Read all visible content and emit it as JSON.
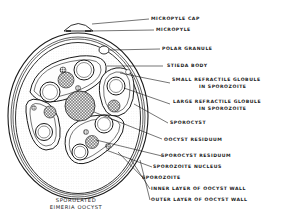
{
  "diagram": {
    "title_line1": "SPORULATED",
    "title_line2": "EIMERIA OOCYST",
    "labels": [
      {
        "id": "micropyle-cap",
        "text": "MICROPYLE CAP"
      },
      {
        "id": "micropyle",
        "text": "MICROPYLE"
      },
      {
        "id": "polar-granule",
        "text": "POLAR GRANULE"
      },
      {
        "id": "stieda-body",
        "text": "STIEDA BODY"
      },
      {
        "id": "small-refractile-globule",
        "line1": "SMALL REFRACTILE GLOBULE",
        "line2": "IN SPOROZOITE"
      },
      {
        "id": "large-refractile-globule",
        "line1": "LARGE REFRACTILE GLOBULE",
        "line2": "IN SPOROZOITE"
      },
      {
        "id": "sporocyst",
        "text": "SPOROCYST"
      },
      {
        "id": "oocyst-residuum",
        "text": "OOCYST RESIDUUM"
      },
      {
        "id": "sporocyst-residuum",
        "text": "SPOROCYST RESIDUUM"
      },
      {
        "id": "sporozoite-nucleus",
        "text": "SPOROZOITE NUCLEUS"
      },
      {
        "id": "sporozoite",
        "text": "SPOROZOITE"
      },
      {
        "id": "inner-layer",
        "text": "INNER LAYER OF OOCYST WALL"
      },
      {
        "id": "outer-layer",
        "text": "OUTER LAYER OF OOCYST WALL"
      }
    ],
    "colors": {
      "ink": "#1a1a1a",
      "background": "#ffffff"
    }
  }
}
